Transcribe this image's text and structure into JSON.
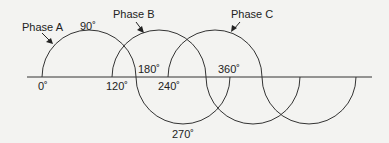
{
  "diagram": {
    "phases": [
      {
        "label": "Phase A",
        "start_deg": 0
      },
      {
        "label": "Phase B",
        "start_deg": 120
      },
      {
        "label": "Phase C",
        "start_deg": 240
      }
    ],
    "degree_labels": {
      "d0": "0˚",
      "d90": "90˚",
      "d120": "120˚",
      "d180": "180˚",
      "d240": "240˚",
      "d270": "270˚",
      "d360": "360˚"
    },
    "colors": {
      "stroke": "#333333",
      "background": "#f3f3f1",
      "text": "#222222"
    }
  }
}
